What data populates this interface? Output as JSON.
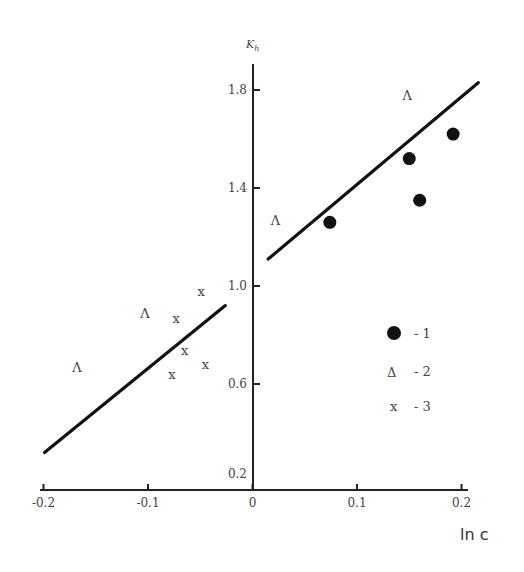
{
  "chart_data": {
    "type": "scatter",
    "title": "",
    "xlabel": "ln c",
    "ylabel": "K_h",
    "ylabel_main": "K",
    "ylabel_sub": "h",
    "xlim": [
      -0.2,
      0.2
    ],
    "ylim": [
      0.2,
      1.9
    ],
    "x_ticks": [
      -0.2,
      -0.1,
      0,
      0.1,
      0.2
    ],
    "x_tick_labels": [
      "-0.2",
      "-0.1",
      "0",
      "0.1",
      "0.2"
    ],
    "y_ticks": [
      0.2,
      0.6,
      1.0,
      1.4,
      1.8
    ],
    "y_tick_labels": [
      "0.2",
      "0.6",
      "1.0",
      "1.4",
      "1.8"
    ],
    "grid": false,
    "legend_position": "right-middle",
    "series": [
      {
        "name": "1",
        "marker": "filled-circle",
        "points": [
          [
            0.074,
            1.26
          ],
          [
            0.15,
            1.52
          ],
          [
            0.16,
            1.35
          ],
          [
            0.192,
            1.62
          ]
        ]
      },
      {
        "name": "2",
        "marker": "triangle",
        "points": [
          [
            0.148,
            1.78
          ],
          [
            0.022,
            1.27
          ],
          [
            -0.103,
            0.89
          ],
          [
            -0.168,
            0.67
          ]
        ]
      },
      {
        "name": "3",
        "marker": "x",
        "points": [
          [
            -0.049,
            0.98
          ],
          [
            -0.073,
            0.87
          ],
          [
            -0.065,
            0.74
          ],
          [
            -0.045,
            0.68
          ],
          [
            -0.077,
            0.64
          ]
        ]
      }
    ],
    "fit_lines": [
      {
        "name": "fit-right",
        "from": [
          0.015,
          1.11
        ],
        "to": [
          0.216,
          1.83
        ]
      },
      {
        "name": "fit-left",
        "from": [
          -0.199,
          0.32
        ],
        "to": [
          -0.026,
          0.92
        ]
      }
    ],
    "legend": [
      {
        "symbol": "●",
        "label": "- 1"
      },
      {
        "symbol": "Δ",
        "label": "- 2"
      },
      {
        "symbol": "x",
        "label": "- 3"
      }
    ],
    "marker_glyphs": {
      "triangle": "Λ",
      "x": "x"
    }
  }
}
